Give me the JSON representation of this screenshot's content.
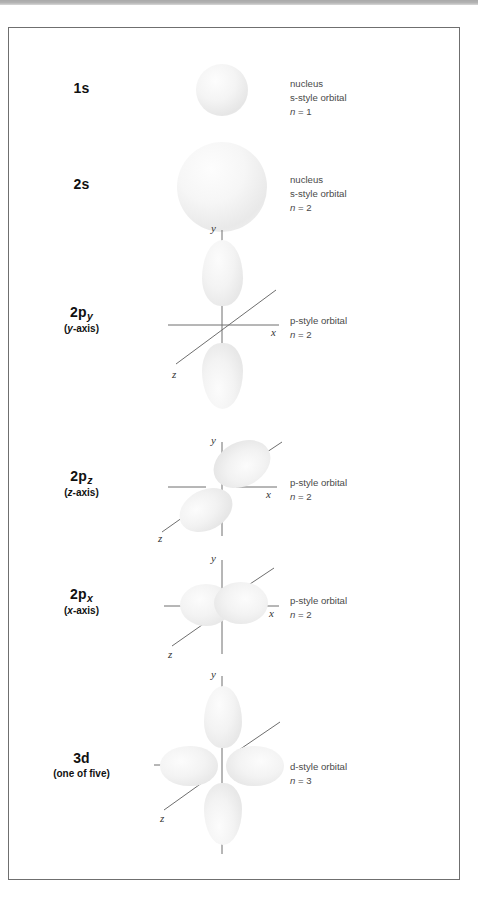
{
  "figure": {
    "kind": "atomic-orbital-shapes-diagram",
    "background": "#ffffff",
    "border_color": "#6f6f6f",
    "orbital_fill": "#ededed",
    "axis_color": "#6e6e6e",
    "note_color": "#4a4a4a",
    "label_color": "#111111"
  },
  "rows": [
    {
      "id": "1s",
      "label_main": "1s",
      "label_sub": "",
      "label_second": "",
      "note": [
        "nucleus",
        "s-style orbital"
      ],
      "note_n_var": "n",
      "note_n_value": "= 1",
      "orbital_type": "s",
      "axes": []
    },
    {
      "id": "2s",
      "label_main": "2s",
      "label_sub": "",
      "label_second": "",
      "note": [
        "nucleus",
        "s-style orbital"
      ],
      "note_n_var": "n",
      "note_n_value": "= 2",
      "orbital_type": "s",
      "axes": []
    },
    {
      "id": "2py",
      "label_main": "2p",
      "label_sub": "y",
      "label_second_pre": "(",
      "label_second_var": "y",
      "label_second_post": "-axis)",
      "note": [
        "p-style orbital"
      ],
      "note_n_var": "n",
      "note_n_value": "= 2",
      "orbital_type": "p-vertical",
      "axis_labels": {
        "x": "x",
        "y": "y",
        "z": "z"
      }
    },
    {
      "id": "2pz",
      "label_main": "2p",
      "label_sub": "z",
      "label_second_pre": "(",
      "label_second_var": "z",
      "label_second_post": "-axis)",
      "note": [
        "p-style orbital"
      ],
      "note_n_var": "n",
      "note_n_value": "= 2",
      "orbital_type": "p-diagonal",
      "axis_labels": {
        "x": "x",
        "y": "y",
        "z": "z"
      }
    },
    {
      "id": "2px",
      "label_main": "2p",
      "label_sub": "x",
      "label_second_pre": "(",
      "label_second_var": "x",
      "label_second_post": "-axis)",
      "note": [
        "p-style orbital"
      ],
      "note_n_var": "n",
      "note_n_value": "= 2",
      "orbital_type": "p-horizontal",
      "axis_labels": {
        "x": "x",
        "y": "y",
        "z": "z"
      }
    },
    {
      "id": "3d",
      "label_main": "3d",
      "label_sub": "",
      "label_second": "(one of five)",
      "note": [
        "d-style orbital"
      ],
      "note_n_var": "n",
      "note_n_value": "= 3",
      "orbital_type": "d-four-lobe",
      "axis_labels": {
        "x": "x",
        "y": "y",
        "z": "z"
      }
    }
  ]
}
